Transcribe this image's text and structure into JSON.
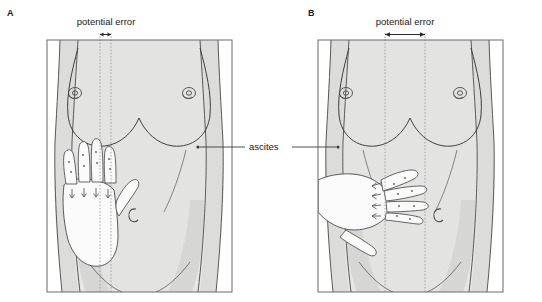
{
  "figure": {
    "type": "medical-illustration",
    "panels": [
      {
        "id": "A",
        "letter": "A",
        "letter_pos": {
          "x": 10,
          "y": 13
        },
        "caption_label": "potential error",
        "caption_pos": {
          "x": 105,
          "y": 22
        },
        "error_arrow": {
          "x1": 100,
          "x2": 111,
          "y": 35
        },
        "dotted_lines": [
          {
            "x": 100,
            "y1": 33,
            "y2": 292
          },
          {
            "x": 111,
            "y1": 33,
            "y2": 292
          }
        ],
        "hand_orientation": "vertical-fingers-up",
        "hand_pos": {
          "x": 62,
          "y": 150
        },
        "frame": {
          "x": 47,
          "y": 40,
          "w": 185,
          "h": 252
        }
      },
      {
        "id": "B",
        "letter": "B",
        "letter_pos": {
          "x": 311,
          "y": 13
        },
        "caption_label": "potential error",
        "caption_pos": {
          "x": 405,
          "y": 22
        },
        "error_arrow": {
          "x1": 385,
          "x2": 425,
          "y": 35
        },
        "dotted_lines": [
          {
            "x": 385,
            "y1": 33,
            "y2": 292
          },
          {
            "x": 425,
            "y1": 33,
            "y2": 292
          }
        ],
        "hand_orientation": "horizontal-fingers-right",
        "hand_pos": {
          "x": 330,
          "y": 175
        },
        "frame": {
          "x": 318,
          "y": 40,
          "w": 185,
          "h": 252
        }
      }
    ],
    "annotation": {
      "label": "ascites",
      "label_pos": {
        "x": 256,
        "y": 147
      },
      "leader_left": {
        "x1": 245,
        "x2": 200,
        "y": 147,
        "dot_x": 198
      },
      "leader_right": {
        "x1": 292,
        "x2": 336,
        "y": 147,
        "dot_x": 338
      }
    },
    "colors": {
      "skin_fill": "#e3e3e1",
      "skin_shadow": "#d2d2d0",
      "hand_fill": "#fafafa",
      "outline": "#4a4a4a",
      "frame_border": "#6b6b6b",
      "text": "#1a1a1a",
      "dotted_line": "#8a8a8a",
      "background": "#ffffff"
    }
  }
}
